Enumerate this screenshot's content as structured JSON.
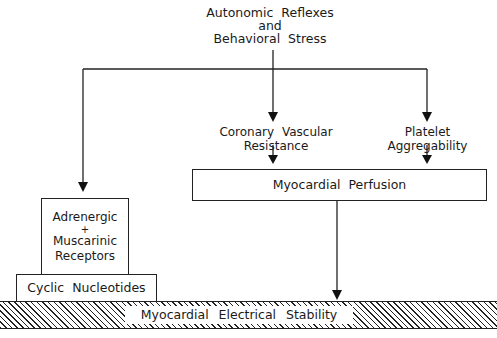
{
  "diagram": {
    "source_node": {
      "line1": "Autonomic Reflexes",
      "line2": "and",
      "line3": "Behavioral Stress"
    },
    "nodes": {
      "coronary": {
        "line1": "Coronary Vascular",
        "line2": "Resistance"
      },
      "platelet": {
        "line1": "Platelet",
        "line2": "Aggregability"
      },
      "perfusion": {
        "label": "Myocardial Perfusion"
      },
      "receptors": {
        "line1": "Adrenergic",
        "line2": "+",
        "line3": "Muscarinic",
        "line4": "Receptors"
      },
      "nucleotides": {
        "label": "Cyclic Nucleotides"
      },
      "stability": {
        "label": "Myocardial Electrical Stability"
      }
    },
    "edges": [
      {
        "from": "Autonomic Reflexes and Behavioral Stress",
        "to": "Adrenergic + Muscarinic Receptors"
      },
      {
        "from": "Autonomic Reflexes and Behavioral Stress",
        "to": "Coronary Vascular Resistance"
      },
      {
        "from": "Autonomic Reflexes and Behavioral Stress",
        "to": "Platelet Aggregability"
      },
      {
        "from": "Coronary Vascular Resistance",
        "to": "Myocardial Perfusion"
      },
      {
        "from": "Platelet Aggregability",
        "to": "Myocardial Perfusion"
      },
      {
        "from": "Myocardial Perfusion",
        "to": "Myocardial Electrical Stability"
      }
    ],
    "colors": {
      "line": "#222222",
      "background": "#ffffff"
    }
  }
}
